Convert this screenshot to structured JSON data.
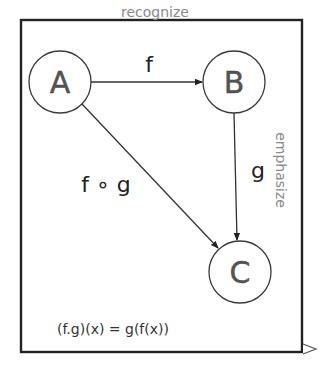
{
  "diagram": {
    "nodes": [
      {
        "id": "A",
        "label": "A"
      },
      {
        "id": "B",
        "label": "B"
      },
      {
        "id": "C",
        "label": "C"
      }
    ],
    "edges": [
      {
        "from": "A",
        "to": "B",
        "label": "f"
      },
      {
        "from": "B",
        "to": "C",
        "label": "g"
      },
      {
        "from": "A",
        "to": "C",
        "label": "f ∘ g"
      }
    ],
    "annotations": {
      "top": "recognize",
      "right": "emphasize"
    },
    "formula": "(f.g)(x) = g(f(x))",
    "colors": {
      "stroke": "#333333",
      "annotation": "#8a8a8a",
      "frame": "#222222"
    }
  }
}
